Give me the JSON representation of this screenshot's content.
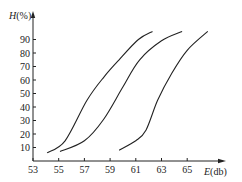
{
  "chart_data": {
    "type": "line",
    "title": "",
    "xlabel": "E(db)",
    "ylabel": "H(%)",
    "xlim": [
      53,
      67
    ],
    "ylim": [
      0,
      100
    ],
    "grid": false,
    "legend": null,
    "x_ticks": [
      53,
      55,
      57,
      59,
      61,
      63,
      65
    ],
    "y_ticks": [
      10,
      20,
      30,
      40,
      50,
      60,
      70,
      80,
      90
    ],
    "series": [
      {
        "name": "curve-1",
        "points": [
          [
            54.1,
            6
          ],
          [
            55.5,
            15
          ],
          [
            57.2,
            45
          ],
          [
            58.5,
            62
          ],
          [
            59.7,
            75
          ],
          [
            61.2,
            90
          ],
          [
            62.3,
            96
          ]
        ]
      },
      {
        "name": "curve-2",
        "points": [
          [
            55.1,
            7
          ],
          [
            57.0,
            15
          ],
          [
            58.5,
            31
          ],
          [
            60.0,
            55
          ],
          [
            61.3,
            75
          ],
          [
            63.0,
            89
          ],
          [
            64.6,
            96
          ]
        ]
      },
      {
        "name": "curve-3",
        "points": [
          [
            59.7,
            8
          ],
          [
            61.0,
            15
          ],
          [
            61.8,
            23
          ],
          [
            62.7,
            45
          ],
          [
            63.8,
            65
          ],
          [
            65.0,
            82
          ],
          [
            66.6,
            96
          ]
        ]
      }
    ]
  },
  "labels": {
    "ylabel": "H(%)",
    "xlabel_italic": "E",
    "xlabel_rest": "(db)"
  }
}
